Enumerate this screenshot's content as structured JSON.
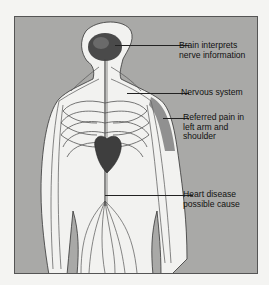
{
  "diagram": {
    "background_color": "#a9a9a7",
    "figure_color": "#f2f2f0",
    "labels": [
      {
        "id": "brain",
        "text": "Brain interprets\nnerve information"
      },
      {
        "id": "nervous-system",
        "text": "Nervous system"
      },
      {
        "id": "referred-pain",
        "text": "Referred pain in\nleft arm and\nshoulder"
      },
      {
        "id": "heart",
        "text": "Heart disease\npossible cause"
      }
    ]
  }
}
